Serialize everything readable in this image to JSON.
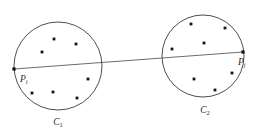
{
  "figure": {
    "type": "diagram",
    "background_color": "#ffffff",
    "stroke_color": "#3a3a3a",
    "line_color": "#5a5a5a",
    "point_color": "#141414",
    "width": 258,
    "height": 137
  },
  "clusters": [
    {
      "id": "C1",
      "label_base": "C",
      "label_sub": "1",
      "label_x": 58,
      "label_y": 125,
      "center_x": 58,
      "center_y": 66,
      "radius": 44,
      "points": [
        {
          "x": 54,
          "y": 39
        },
        {
          "x": 76,
          "y": 44
        },
        {
          "x": 42,
          "y": 52
        },
        {
          "x": 88,
          "y": 79
        },
        {
          "x": 32,
          "y": 93
        },
        {
          "x": 53,
          "y": 92
        },
        {
          "x": 77,
          "y": 98
        }
      ]
    },
    {
      "id": "C2",
      "label_base": "C",
      "label_sub": "2",
      "label_x": 205,
      "label_y": 113,
      "center_x": 203,
      "center_y": 56,
      "radius": 41,
      "points": [
        {
          "x": 191,
          "y": 24
        },
        {
          "x": 225,
          "y": 28
        },
        {
          "x": 204,
          "y": 43
        },
        {
          "x": 172,
          "y": 49
        },
        {
          "x": 194,
          "y": 79
        },
        {
          "x": 232,
          "y": 73
        },
        {
          "x": 215,
          "y": 90
        }
      ]
    }
  ],
  "endpoints": [
    {
      "id": "Pi",
      "label_base": "P",
      "label_sub": "i",
      "x": 14,
      "y": 69,
      "label_x": 20,
      "label_y": 82
    },
    {
      "id": "Pj",
      "label_base": "P",
      "label_sub": "j",
      "x": 243,
      "y": 52,
      "label_x": 238,
      "label_y": 65
    }
  ],
  "connector": {
    "x1": 14,
    "y1": 69,
    "x2": 243,
    "y2": 52,
    "intersections": [
      {
        "x": 101,
        "y": 62
      },
      {
        "x": 163,
        "y": 57
      }
    ]
  }
}
